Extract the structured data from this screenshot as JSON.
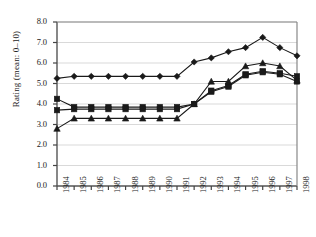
{
  "chart_data": {
    "type": "line",
    "title": "",
    "xlabel": "",
    "ylabel": "Rating (mean: 0–10)",
    "x": [
      1984,
      1985,
      1986,
      1987,
      1988,
      1989,
      1990,
      1991,
      1992,
      1993,
      1994,
      1995,
      1996,
      1997,
      1998
    ],
    "categories": [
      "1984",
      "1985",
      "1986",
      "1987",
      "1988",
      "1989",
      "1990",
      "1991",
      "1992",
      "1993",
      "1994",
      "1995",
      "1996",
      "1997",
      "1998"
    ],
    "xlim": [
      1983.5,
      1998.5
    ],
    "ylim": [
      0.0,
      8.0
    ],
    "yticks": [
      "0.0",
      "1.0",
      "2.0",
      "3.0",
      "4.0",
      "5.0",
      "6.0",
      "7.0",
      "8.0"
    ],
    "ytick_values": [
      0.0,
      1.0,
      2.0,
      3.0,
      4.0,
      5.0,
      6.0,
      7.0,
      8.0
    ],
    "grid": "horizontal",
    "grid_color": "#d9d9d9",
    "legend": "none",
    "line_color": "#1a1a1a",
    "series": [
      {
        "name": "series-diamond",
        "marker": "diamond",
        "color": "#1a1a1a",
        "values": [
          5.25,
          5.35,
          5.35,
          5.35,
          5.35,
          5.35,
          5.35,
          5.35,
          6.05,
          6.25,
          6.55,
          6.75,
          7.25,
          6.75,
          6.35
        ]
      },
      {
        "name": "series-square-upper",
        "marker": "square",
        "color": "#1a1a1a",
        "values": [
          4.25,
          3.85,
          3.85,
          3.85,
          3.85,
          3.85,
          3.85,
          3.85,
          4.0,
          4.65,
          4.9,
          5.45,
          5.6,
          5.5,
          5.35
        ]
      },
      {
        "name": "series-square-lower",
        "marker": "square",
        "color": "#1a1a1a",
        "values": [
          3.7,
          3.75,
          3.75,
          3.75,
          3.75,
          3.75,
          3.75,
          3.75,
          4.0,
          4.6,
          4.85,
          5.4,
          5.55,
          5.45,
          5.1
        ]
      },
      {
        "name": "series-triangle",
        "marker": "triangle",
        "color": "#1a1a1a",
        "values": [
          2.8,
          3.3,
          3.3,
          3.3,
          3.3,
          3.3,
          3.3,
          3.3,
          4.0,
          5.1,
          5.1,
          5.85,
          6.0,
          5.85,
          5.15
        ]
      }
    ]
  }
}
